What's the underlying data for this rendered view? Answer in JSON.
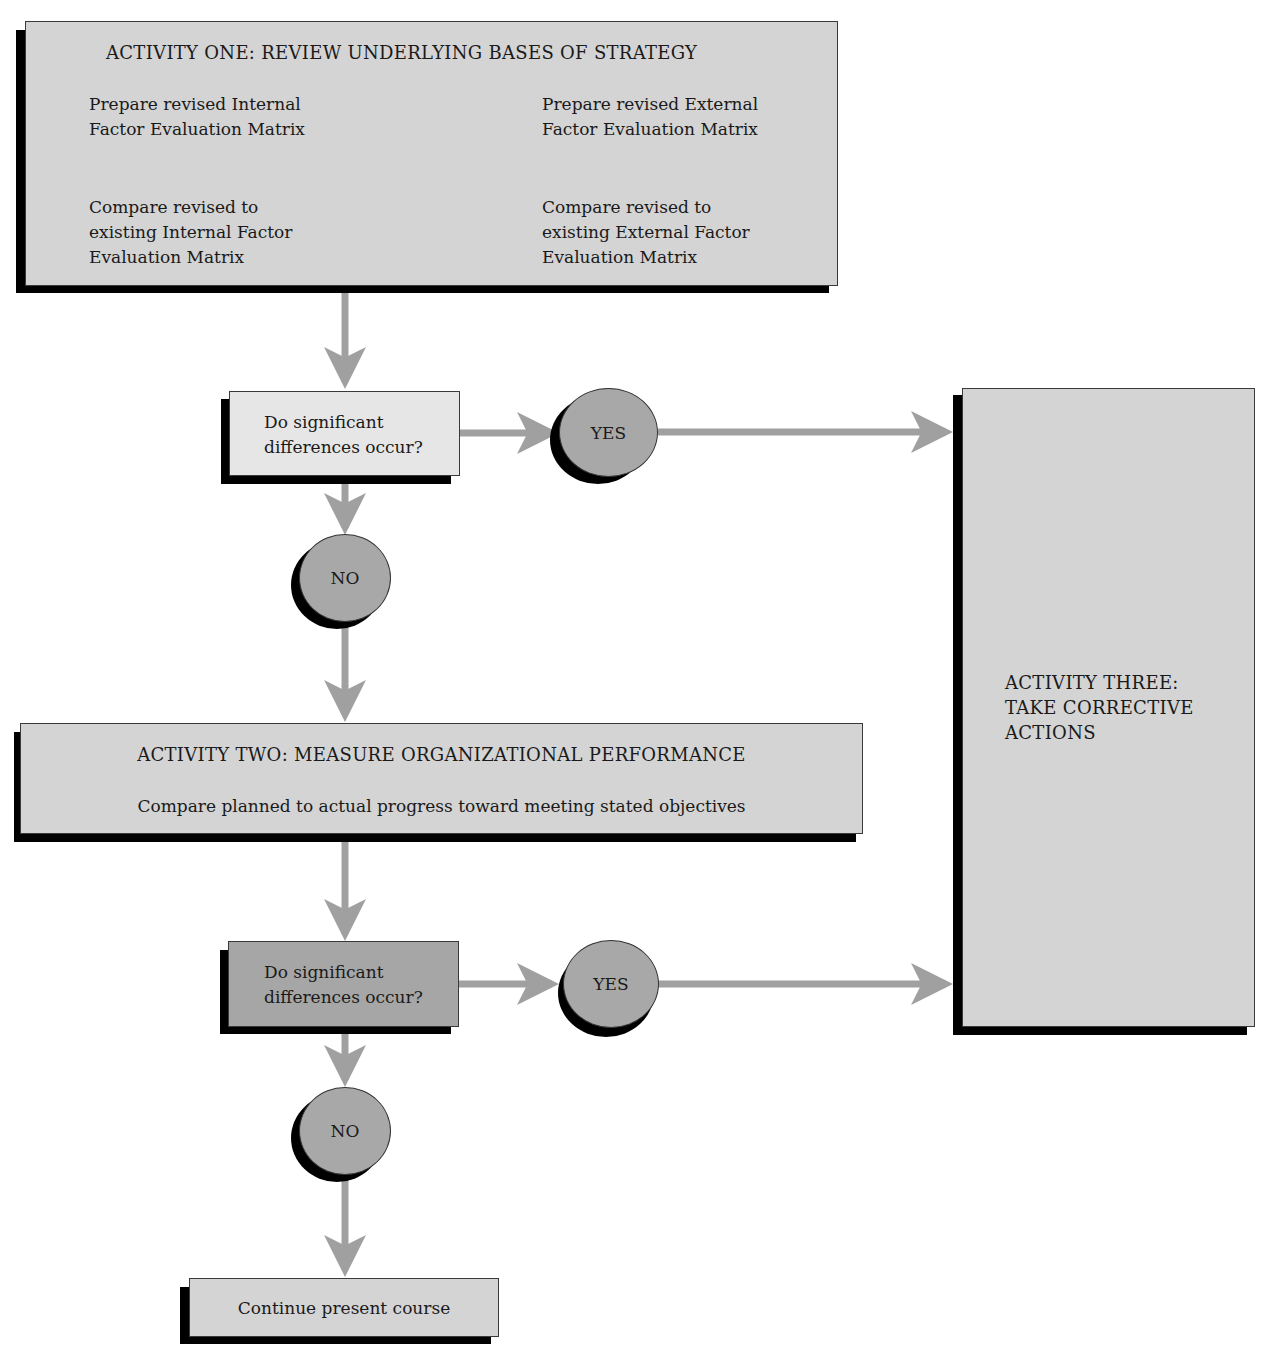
{
  "colors": {
    "box_fill": "#d4d4d4",
    "decision1_fill": "#e6e6e6",
    "decision2_fill": "#a6a6a6",
    "circle_fill": "#a8a8a8",
    "shadow": "#000000",
    "arrow": "#a0a0a0"
  },
  "activity_one": {
    "title": "ACTIVITY ONE: REVIEW UNDERLYING BASES OF STRATEGY",
    "left_top": "Prepare revised Internal\nFactor Evaluation Matrix",
    "right_top": "Prepare revised External\nFactor Evaluation Matrix",
    "left_bottom": "Compare revised to\nexisting Internal Factor\nEvaluation Matrix",
    "right_bottom": "Compare revised to\nexisting External Factor\nEvaluation Matrix"
  },
  "decision_one": {
    "question": "Do significant\ndifferences occur?",
    "yes_label": "YES",
    "no_label": "NO"
  },
  "activity_two": {
    "title": "ACTIVITY TWO: MEASURE ORGANIZATIONAL PERFORMANCE",
    "description": "Compare planned to actual progress toward meeting stated objectives"
  },
  "decision_two": {
    "question": "Do significant\ndifferences occur?",
    "yes_label": "YES",
    "no_label": "NO"
  },
  "activity_three": {
    "title": "ACTIVITY THREE:\nTAKE CORRECTIVE\nACTIONS"
  },
  "end_node": {
    "label": "Continue present course"
  }
}
